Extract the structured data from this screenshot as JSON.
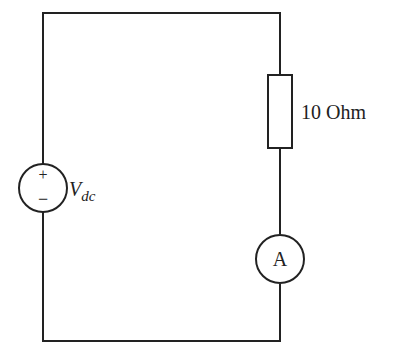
{
  "diagram": {
    "type": "circuit",
    "components": {
      "source": {
        "kind": "dc-voltage-source",
        "plus_label": "+",
        "minus_label": "−",
        "label_main": "V",
        "label_sub": "dc"
      },
      "resistor": {
        "kind": "resistor",
        "label": "10 Ohm"
      },
      "ammeter": {
        "kind": "ammeter",
        "label": "A"
      }
    },
    "colors": {
      "line": "#222222",
      "background": "#ffffff"
    }
  }
}
